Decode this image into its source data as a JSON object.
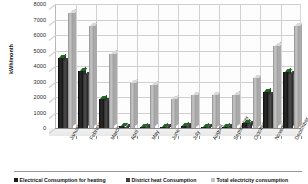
{
  "chart_data": {
    "type": "bar",
    "title": "",
    "xlabel": "",
    "ylabel": "kWh/month",
    "ylim": [
      0,
      8000
    ],
    "ytick_labels": [
      "8000",
      "7000",
      "6000",
      "5000",
      "4000",
      "3000",
      "2000",
      "1000",
      "0"
    ],
    "ytick_values": [
      8000,
      7000,
      6000,
      5000,
      4000,
      3000,
      2000,
      1000,
      0
    ],
    "grid": true,
    "legend_position": "bottom",
    "categories": [
      "January",
      "February",
      "March",
      "April",
      "May",
      "June",
      "July",
      "August",
      "September",
      "October",
      "November",
      "December"
    ],
    "series": [
      {
        "name": "Electrical Consumption for heating",
        "color": "#1a1a1a",
        "values": [
          4500,
          3700,
          1900,
          100,
          80,
          90,
          110,
          90,
          80,
          300,
          2300,
          3600
        ]
      },
      {
        "name": "District heat Consumption",
        "color": "#3f3f3f",
        "values": [
          4350,
          3450,
          1750,
          90,
          70,
          80,
          100,
          80,
          70,
          280,
          2100,
          3500
        ]
      },
      {
        "name": "Total electricity consumption",
        "color": "#c4c4c4",
        "values": [
          7400,
          6600,
          4800,
          2900,
          2750,
          1900,
          2100,
          2100,
          2150,
          3200,
          5300,
          6550
        ]
      }
    ]
  },
  "legend": {
    "items": [
      {
        "label": "Electrical Consumption for heating"
      },
      {
        "label": "District heat Consumption"
      },
      {
        "label": "Total electricity consumption"
      }
    ]
  }
}
